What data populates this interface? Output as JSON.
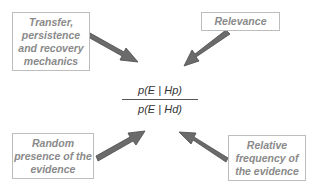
{
  "diagram": {
    "formula": {
      "numerator": "p(E | Hp)",
      "denominator": "p(E | Hd)"
    },
    "boxes": [
      {
        "id": "transfer",
        "label": "Transfer, persistence and recovery mechanics",
        "position": "top-left"
      },
      {
        "id": "relevance",
        "label": "Relevance",
        "position": "top-right"
      },
      {
        "id": "random",
        "label": "Random presence of the evidence",
        "position": "bottom-left"
      },
      {
        "id": "relative",
        "label": "Relative frequency of the evidence",
        "position": "bottom-right"
      }
    ],
    "colors": {
      "arrow_fill": "#6b6b6b",
      "arrow_stroke": "#4a4a4a",
      "box_text": "#8a8a8a",
      "box_border": "#bdbdbd"
    }
  }
}
